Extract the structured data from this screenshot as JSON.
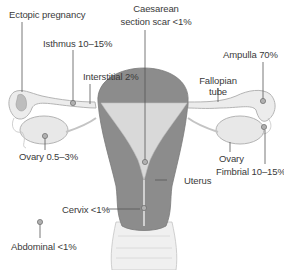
{
  "diagram": {
    "colors": {
      "uterus_wall": "#8c8c8c",
      "uterus_cavity": "#d9d9d9",
      "tube_fill": "#ececec",
      "outline": "#b4b4b4",
      "leader_line": "#555555",
      "text": "#3a3a3a",
      "marker": "#9a9a9a"
    },
    "labels": {
      "ectopic_pregnancy": "Ectopic pregnancy",
      "caesarean_line1": "Caesarean",
      "caesarean_line2": "section scar <1%",
      "isthmus": "Isthmus 10–15%",
      "interstitial": "Interstitial 2%",
      "ampulla": "Ampulla 70%",
      "fallopian_line1": "Fallopian",
      "fallopian_line2": "tube",
      "ovary_site": "Ovary 0.5–3%",
      "ovary": "Ovary",
      "fimbrial": "Fimbrial 10–15%",
      "uterus": "Uterus",
      "cervix": "Cervix <1%",
      "abdominal": "Abdominal <1%"
    },
    "sites": [
      {
        "name": "Ampulla",
        "percent": "70%"
      },
      {
        "name": "Isthmus",
        "percent": "10–15%"
      },
      {
        "name": "Fimbrial",
        "percent": "10–15%"
      },
      {
        "name": "Ovary",
        "percent": "0.5–3%"
      },
      {
        "name": "Interstitial",
        "percent": "2%"
      },
      {
        "name": "Caesarean section scar",
        "percent": "<1%"
      },
      {
        "name": "Cervix",
        "percent": "<1%"
      },
      {
        "name": "Abdominal",
        "percent": "<1%"
      }
    ]
  }
}
